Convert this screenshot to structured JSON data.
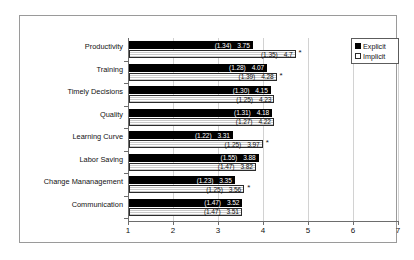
{
  "chart_data": {
    "type": "bar",
    "orientation": "horizontal",
    "title": "",
    "xlabel": "",
    "ylabel": "",
    "xlim": [
      1,
      7
    ],
    "xticks": [
      "1",
      "2",
      "3",
      "4",
      "5",
      "6",
      "7"
    ],
    "grid": true,
    "legend_position": "top-right",
    "categories": [
      "Productivity",
      "Training",
      "Timely Decisions",
      "Quality",
      "Learning Curve",
      "Labor Saving",
      "Change Mananagement",
      "Communication"
    ],
    "series": [
      {
        "name": "Explicit",
        "color": "#000000",
        "values": [
          3.75,
          4.07,
          4.15,
          4.18,
          3.31,
          3.88,
          3.35,
          3.52
        ],
        "sd": [
          "1.34",
          "1.28",
          "1.30",
          "1.31",
          "1.22",
          "1.55",
          "1.23",
          "1.47"
        ],
        "value_labels": [
          "3.75",
          "4.07",
          "4.15",
          "4.18",
          "3.31",
          "3.88",
          "3.35",
          "3.52"
        ],
        "sd_labels": [
          "(1.34)",
          "(1.28)",
          "(1.30)",
          "(1.31)",
          "(1.22)",
          "(1.55)",
          "(1.23)",
          "(1.47)"
        ]
      },
      {
        "name": "Implicit",
        "color": "#ffffff",
        "values": [
          4.7,
          4.28,
          4.23,
          4.22,
          3.97,
          3.82,
          3.56,
          3.51
        ],
        "sd": [
          "1.35",
          "1.39",
          "1.25",
          "1.27",
          "1.25",
          "1.47",
          "1.25",
          "1.47"
        ],
        "value_labels": [
          "4.7",
          "4.28",
          "4.23",
          "4.22",
          "3.97",
          "3.82",
          "3.56",
          "3.51"
        ],
        "sd_labels": [
          "(1.35)",
          "(1.39)",
          "(1.25)",
          "(1.27)",
          "(1.25)",
          "(1.47)",
          "(1.25)",
          "(1.47)"
        ]
      }
    ],
    "annotations": {
      "significance_marker": "*",
      "marked_categories": [
        "Productivity",
        "Training",
        "Learning Curve",
        "Change Mananagement"
      ]
    }
  },
  "legend": {
    "items": [
      {
        "label": "Explicit",
        "swatch": "filled-square-icon"
      },
      {
        "label": "Implicit",
        "swatch": "hollow-square-icon"
      }
    ]
  }
}
